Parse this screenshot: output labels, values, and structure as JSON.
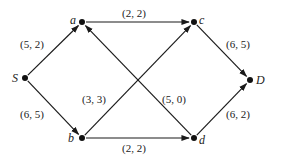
{
  "diagram": {
    "type": "flow-network",
    "nodes": [
      {
        "id": "S",
        "label": "S",
        "x": 25,
        "y": 78,
        "lx": 12,
        "ly": 82
      },
      {
        "id": "a",
        "label": "a",
        "x": 82,
        "y": 22,
        "lx": 70,
        "ly": 24
      },
      {
        "id": "c",
        "label": "c",
        "x": 194,
        "y": 22,
        "lx": 199,
        "ly": 24
      },
      {
        "id": "b",
        "label": "b",
        "x": 82,
        "y": 138,
        "lx": 68,
        "ly": 142
      },
      {
        "id": "d",
        "label": "d",
        "x": 194,
        "y": 138,
        "lx": 199,
        "ly": 144
      },
      {
        "id": "D",
        "label": "D",
        "x": 250,
        "y": 80,
        "lx": 256,
        "ly": 84
      }
    ],
    "edges": [
      {
        "from": "S",
        "to": "a",
        "label": "(5, 2)",
        "lx": 20,
        "ly": 48
      },
      {
        "from": "S",
        "to": "b",
        "label": "(6, 5)",
        "lx": 20,
        "ly": 118
      },
      {
        "from": "a",
        "to": "c",
        "label": "(2, 2)",
        "lx": 122,
        "ly": 17
      },
      {
        "from": "b",
        "to": "c",
        "label": "(3, 3)",
        "lx": 82,
        "ly": 103
      },
      {
        "from": "d",
        "to": "a",
        "label": "(5, 0)",
        "lx": 162,
        "ly": 103
      },
      {
        "from": "b",
        "to": "d",
        "label": "(2, 2)",
        "lx": 122,
        "ly": 152
      },
      {
        "from": "c",
        "to": "D",
        "label": "(6, 5)",
        "lx": 226,
        "ly": 48
      },
      {
        "from": "d",
        "to": "D",
        "label": "(6, 2)",
        "lx": 226,
        "ly": 118
      }
    ]
  }
}
